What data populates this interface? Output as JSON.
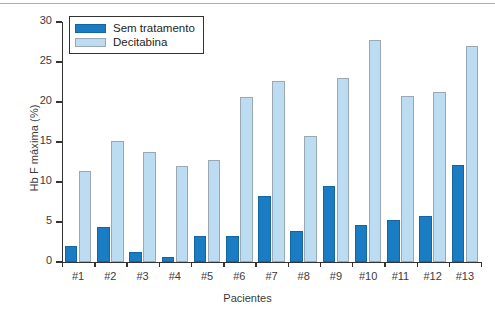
{
  "chart_data": {
    "type": "bar",
    "title": "",
    "xlabel": "Pacientes",
    "ylabel": "Hb F máxima (%)",
    "ylim": [
      0,
      30
    ],
    "yticks": [
      0,
      5,
      10,
      15,
      20,
      25,
      30
    ],
    "grid": false,
    "legend_position": "top-left",
    "categories": [
      "#1",
      "#2",
      "#3",
      "#4",
      "#5",
      "#6",
      "#7",
      "#8",
      "#9",
      "#10",
      "#11",
      "#12",
      "#13"
    ],
    "series": [
      {
        "name": "Sem tratamento",
        "color": "#1a7dc4",
        "values": [
          2.0,
          4.4,
          1.3,
          0.6,
          3.2,
          3.2,
          8.3,
          3.9,
          9.5,
          4.6,
          5.2,
          5.8,
          12.1
        ]
      },
      {
        "name": "Decitabina",
        "color": "#bcdcf2",
        "values": [
          11.4,
          15.1,
          13.8,
          12.0,
          12.7,
          20.6,
          22.6,
          15.8,
          23.0,
          27.7,
          20.7,
          21.3,
          27.0
        ]
      }
    ]
  },
  "axis": {
    "y_label": "Hb F máxima (%)",
    "x_label": "Pacientes"
  }
}
